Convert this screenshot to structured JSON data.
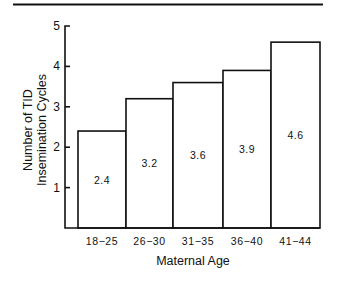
{
  "chart_data": {
    "type": "bar",
    "title": "",
    "categories": [
      "18-25",
      "26-30",
      "31-35",
      "36-40",
      "41-44"
    ],
    "values": [
      2.4,
      3.2,
      3.6,
      3.9,
      4.6
    ],
    "value_labels": [
      "2.4",
      "3.2",
      "3.6",
      "3.9",
      "4.6"
    ],
    "xlabel": "Maternal Age",
    "ylabel_lines": [
      "Number of TID",
      "Insemination Cycles"
    ],
    "ylim": [
      0,
      5
    ],
    "yticks": [
      1,
      2,
      3,
      4,
      5
    ],
    "ytick_labels": [
      "1",
      "2",
      "3",
      "4",
      "5"
    ],
    "grid": false,
    "legend": "none",
    "bar_fill": "#ffffff",
    "bar_stroke": "#111111"
  }
}
